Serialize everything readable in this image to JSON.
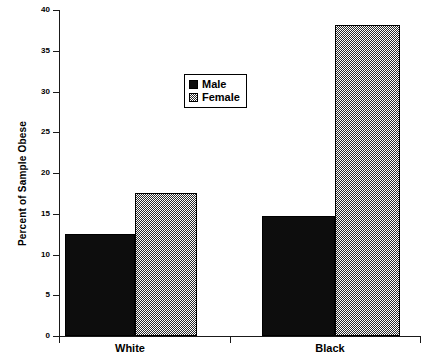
{
  "chart_data": {
    "type": "bar",
    "title": "",
    "xlabel": "",
    "ylabel": "Percent of Sample Obese",
    "categories": [
      "White",
      "Black"
    ],
    "series": [
      {
        "name": "Male",
        "values": [
          12.5,
          14.7
        ],
        "swatch": "solid-black",
        "color": "#0d0d0d"
      },
      {
        "name": "Female",
        "values": [
          17.5,
          38.2
        ],
        "swatch": "dither-gray",
        "color": "#808080"
      }
    ],
    "ylim": [
      0,
      40
    ],
    "ytick_step": 5,
    "yticks": [
      0,
      5,
      10,
      15,
      20,
      25,
      30,
      35,
      40
    ],
    "ytick_labels": [
      "0",
      "5",
      "10",
      "15",
      "20",
      "25",
      "30",
      "35",
      "40"
    ],
    "grid": false,
    "legend_position": "upper-center",
    "legend_entries": [
      "Male",
      "Female"
    ]
  },
  "axes": {
    "y_title": "Percent of Sample Obese",
    "x_labels": [
      "White",
      "Black"
    ]
  },
  "legend": {
    "items": [
      {
        "label": "Male"
      },
      {
        "label": "Female"
      }
    ]
  }
}
